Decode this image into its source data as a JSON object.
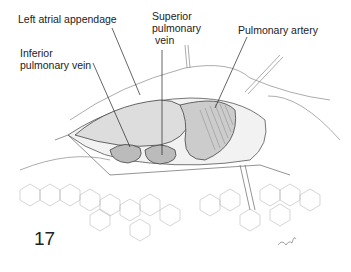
{
  "figure": {
    "number": "17",
    "signature": "ehf",
    "labels": {
      "left_atrial_appendage": "Left atrial appendage",
      "superior_pulmonary_vein_1": "Superior",
      "superior_pulmonary_vein_2": "pulmonary",
      "superior_pulmonary_vein_3": "vein",
      "pulmonary_artery": "Pulmonary artery",
      "inferior_pulmonary_vein_1": "Inferior",
      "inferior_pulmonary_vein_2": "pulmonary vein"
    }
  }
}
